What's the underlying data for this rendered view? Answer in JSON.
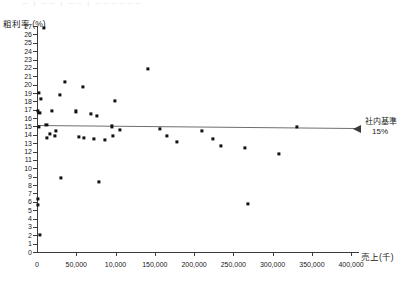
{
  "top_remnant_text": "— | —— | —— | ——————",
  "axes": {
    "y_title": "粗利率 (%)",
    "x_title": "売上(千)",
    "y_ticks": [
      0,
      1,
      2,
      3,
      4,
      5,
      6,
      7,
      8,
      9,
      10,
      11,
      12,
      13,
      14,
      15,
      16,
      17,
      18,
      19,
      20,
      21,
      22,
      23,
      24,
      25,
      26,
      27
    ],
    "x_tick_labels": [
      "0",
      "50,000",
      "10,000",
      "150,000",
      "200,000",
      "250,000",
      "300,000",
      "350,000",
      "400,000"
    ],
    "x_tick_values": [
      0,
      50000,
      100000,
      150000,
      200000,
      250000,
      300000,
      350000,
      400000
    ]
  },
  "reference": {
    "label_line1": "社内基準",
    "label_line2": "15%",
    "value": 15
  },
  "chart_data": {
    "type": "scatter",
    "title": "",
    "xlabel": "売上(千)",
    "ylabel": "粗利率 (%)",
    "xlim": [
      0,
      410000
    ],
    "ylim": [
      0,
      27
    ],
    "grid": false,
    "legend": null,
    "x_tick_labels": [
      "0",
      "50,000",
      "10,000",
      "150,000",
      "200,000",
      "250,000",
      "300,000",
      "350,000",
      "400,000"
    ],
    "y_tick_step": 1,
    "reference_lines": [
      {
        "orientation": "horizontal",
        "value": 15,
        "label": "社内基準 15%",
        "color": "#6e6e6e"
      }
    ],
    "note": "Third x tick label reads '10,000' in the source image, an apparent typo for '100,000'.",
    "points": [
      {
        "x": 9000,
        "y": 26.8
      },
      {
        "x": 2000,
        "y": 19.0
      },
      {
        "x": 4500,
        "y": 18.3
      },
      {
        "x": 1500,
        "y": 16.9
      },
      {
        "x": 3000,
        "y": 16.6
      },
      {
        "x": 2500,
        "y": 14.9
      },
      {
        "x": 1000,
        "y": 6.3
      },
      {
        "x": 1500,
        "y": 5.6
      },
      {
        "x": 3500,
        "y": 2.0
      },
      {
        "x": 36000,
        "y": 20.3
      },
      {
        "x": 29000,
        "y": 18.8
      },
      {
        "x": 19000,
        "y": 16.9
      },
      {
        "x": 12000,
        "y": 15.2
      },
      {
        "x": 24000,
        "y": 14.5
      },
      {
        "x": 16000,
        "y": 14.1
      },
      {
        "x": 23000,
        "y": 13.9
      },
      {
        "x": 13000,
        "y": 13.6
      },
      {
        "x": 30000,
        "y": 8.9
      },
      {
        "x": 59000,
        "y": 19.7
      },
      {
        "x": 49000,
        "y": 16.8
      },
      {
        "x": 69000,
        "y": 16.5
      },
      {
        "x": 76000,
        "y": 16.3
      },
      {
        "x": 53000,
        "y": 13.8
      },
      {
        "x": 60000,
        "y": 13.6
      },
      {
        "x": 72000,
        "y": 13.5
      },
      {
        "x": 79000,
        "y": 8.4
      },
      {
        "x": 86000,
        "y": 13.4
      },
      {
        "x": 99000,
        "y": 18.0
      },
      {
        "x": 95000,
        "y": 15.0
      },
      {
        "x": 97000,
        "y": 13.9
      },
      {
        "x": 105000,
        "y": 14.6
      },
      {
        "x": 141000,
        "y": 21.9
      },
      {
        "x": 156000,
        "y": 14.7
      },
      {
        "x": 165000,
        "y": 13.9
      },
      {
        "x": 178000,
        "y": 13.2
      },
      {
        "x": 210000,
        "y": 14.5
      },
      {
        "x": 224000,
        "y": 13.5
      },
      {
        "x": 234000,
        "y": 12.7
      },
      {
        "x": 265000,
        "y": 12.4
      },
      {
        "x": 268000,
        "y": 5.7
      },
      {
        "x": 308000,
        "y": 11.7
      },
      {
        "x": 331000,
        "y": 14.9
      }
    ]
  }
}
